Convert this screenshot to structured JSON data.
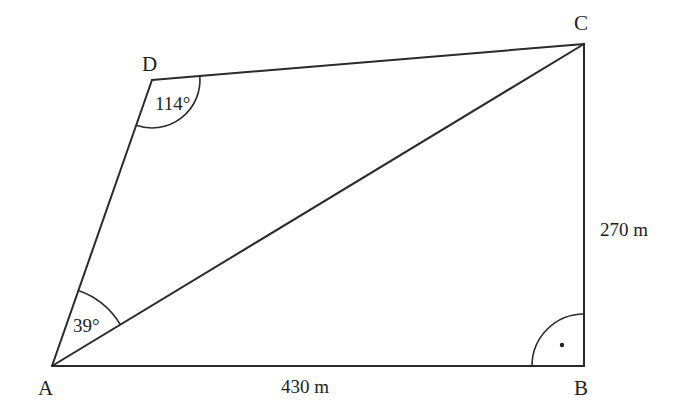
{
  "figure": {
    "type": "quadrilateral with diagonal",
    "vertices": {
      "A": {
        "label": "A",
        "x": 52,
        "y": 366
      },
      "B": {
        "label": "B",
        "x": 584,
        "y": 366
      },
      "C": {
        "label": "C",
        "x": 584,
        "y": 44
      },
      "D": {
        "label": "D",
        "x": 152,
        "y": 80
      }
    },
    "edges": [
      "AB",
      "BC",
      "CD",
      "DA",
      "AC"
    ],
    "measurements": {
      "AB": "430 m",
      "BC": "270 m"
    },
    "angles": {
      "D": "114°",
      "A_DAC": "39°",
      "B": "right angle"
    }
  }
}
